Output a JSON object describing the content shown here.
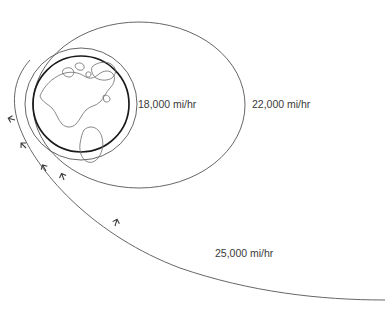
{
  "diagram": {
    "background_color": "#ffffff",
    "line_color": "#555555",
    "earth_outline_color": "#1a1a1a",
    "text_color": "#3a3a3a",
    "earth": {
      "name": "earth-globe",
      "center_x": 81,
      "center_y": 104,
      "radius": 48,
      "visible_continents": "North America and South America"
    },
    "trajectories": [
      {
        "id": "circular-orbit",
        "label": "18,000 mi/hr",
        "speed_value": "18,000",
        "speed_units": "mi/hr",
        "shape": "circle",
        "description": "Circular low orbit just above Earth surface",
        "label_x": 138,
        "label_y": 108
      },
      {
        "id": "elliptical-orbit",
        "label": "22,000 mi/hr",
        "speed_value": "22,000",
        "speed_units": "mi/hr",
        "shape": "ellipse",
        "description": "Large elliptical orbit extending to the right",
        "label_x": 252,
        "label_y": 108
      },
      {
        "id": "escape-trajectory",
        "label": "25,000 mi/hr",
        "speed_value": "25,000",
        "speed_units": "mi/hr",
        "shape": "open-curve",
        "description": "Escape trajectory curving away to lower right",
        "label_x": 215,
        "label_y": 257
      }
    ],
    "arrow_markers": {
      "name": "direction-arrow",
      "count": 5,
      "description": "Small arrowheads indicating direction of travel along each path"
    }
  }
}
